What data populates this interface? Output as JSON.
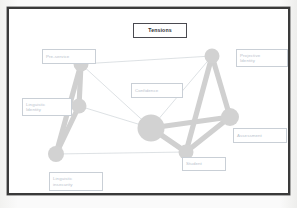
{
  "slide": {
    "title_box": {
      "label": "Tensions",
      "border_color": "#4a4a50",
      "text_color": "#2e2e33"
    },
    "frame_color": "#3a3a3a",
    "background_color": "#ffffff"
  },
  "diagram": {
    "type": "network-graph",
    "node_fill": "#d2d2d2",
    "edge_color_thick": "#d0d0d0",
    "edge_color_thin": "#cfd4d9",
    "label_border_color": "#c9cfd6",
    "label_text_color": "#b9c2cc",
    "nodes": [
      {
        "id": "pre-service",
        "label": "Pre-service",
        "cx": 72,
        "cy": 55,
        "r": 7.5
      },
      {
        "id": "linguistic-identity",
        "label": "Linguistic\nIdentity",
        "cx": 70,
        "cy": 97,
        "r": 7.5
      },
      {
        "id": "linguistic-insecurity",
        "label": "Linguistic\ninsecurity",
        "cx": 47,
        "cy": 145,
        "r": 8.0
      },
      {
        "id": "confidence",
        "label": "Confidence",
        "cx": 142,
        "cy": 119,
        "r": 13.5
      },
      {
        "id": "projective-identity",
        "label": "Projective\nIdentity",
        "cx": 203,
        "cy": 47,
        "r": 7.5
      },
      {
        "id": "assessment",
        "label": "Assessment",
        "cx": 221,
        "cy": 108,
        "r": 9.0
      },
      {
        "id": "student",
        "label": "Student",
        "cx": 177,
        "cy": 143,
        "r": 7.5
      }
    ],
    "edges": [
      {
        "from": "pre-service",
        "to": "linguistic-identity",
        "weight": "thick"
      },
      {
        "from": "pre-service",
        "to": "linguistic-insecurity",
        "weight": "thick"
      },
      {
        "from": "pre-service",
        "to": "confidence",
        "weight": "thin"
      },
      {
        "from": "pre-service",
        "to": "projective-identity",
        "weight": "thin"
      },
      {
        "from": "linguistic-identity",
        "to": "linguistic-insecurity",
        "weight": "thick"
      },
      {
        "from": "linguistic-identity",
        "to": "confidence",
        "weight": "thin"
      },
      {
        "from": "linguistic-insecurity",
        "to": "student",
        "weight": "thin"
      },
      {
        "from": "confidence",
        "to": "assessment",
        "weight": "thick"
      },
      {
        "from": "confidence",
        "to": "student",
        "weight": "thick"
      },
      {
        "from": "confidence",
        "to": "projective-identity",
        "weight": "thin"
      },
      {
        "from": "projective-identity",
        "to": "assessment",
        "weight": "thick"
      },
      {
        "from": "projective-identity",
        "to": "student",
        "weight": "thick"
      },
      {
        "from": "assessment",
        "to": "student",
        "weight": "thick"
      }
    ],
    "label_boxes": [
      {
        "id": "pre-service",
        "text": "Pre-service",
        "x": 33,
        "y": 40,
        "w": 54,
        "h": 15,
        "lines": 1
      },
      {
        "id": "projective-identity",
        "text": "Projective\nIdentity",
        "x": 227,
        "y": 40,
        "w": 52,
        "h": 18,
        "lines": 2
      },
      {
        "id": "linguistic-identity",
        "text": "Linguistic\nIdentity",
        "x": 13,
        "y": 89,
        "w": 50,
        "h": 18,
        "lines": 2
      },
      {
        "id": "confidence",
        "text": "Confidence",
        "x": 122,
        "y": 74,
        "w": 52,
        "h": 15,
        "lines": 1
      },
      {
        "id": "assessment",
        "text": "Assessment",
        "x": 224,
        "y": 119,
        "w": 54,
        "h": 15,
        "lines": 1
      },
      {
        "id": "student",
        "text": "Student",
        "x": 173,
        "y": 148,
        "w": 44,
        "h": 14,
        "lines": 1
      },
      {
        "id": "linguistic-insecurity",
        "text": "Linguistic\ninsecurity",
        "x": 40,
        "y": 163,
        "w": 54,
        "h": 19,
        "lines": 2
      }
    ]
  }
}
